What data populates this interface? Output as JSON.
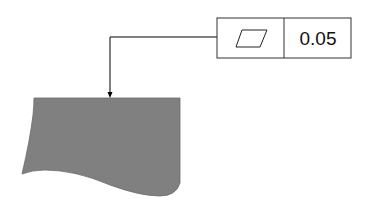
{
  "diagram": {
    "feature_control_frame": {
      "symbol": "flatness-icon",
      "symbol_name": "Flatness",
      "tolerance_value": "0.05"
    },
    "part": {
      "fill_color": "#808080",
      "edge_color": "#555555"
    },
    "leader": {
      "color": "#000000"
    }
  }
}
